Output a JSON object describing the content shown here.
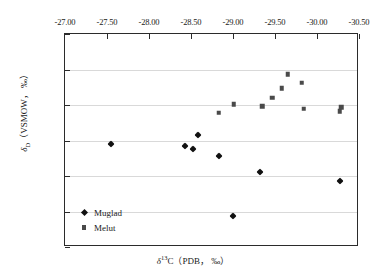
{
  "chart_data": {
    "type": "scatter",
    "title": "",
    "xlabel": "δ¹³C (PDB, ‰)",
    "ylabel": "δD (VSMOW, ‰)",
    "xlabel_parts": {
      "symbol": "δ",
      "superscript": "13",
      "rest": "C（PDB， ‰）"
    },
    "ylabel_parts": {
      "symbol": "δ",
      "subscript": "D",
      "rest": "（VSMOW， ‰）"
    },
    "xlim": [
      -27.0,
      -30.5
    ],
    "ylim": [
      -140,
      -80
    ],
    "x_axis_position": "top",
    "x_tick_labels": [
      "-27.00",
      "-27.50",
      "-28.00",
      "-28.50",
      "-29.00",
      "-29.50",
      "-30.00",
      "-30.50"
    ],
    "x_ticks": [
      -27.0,
      -27.5,
      -28.0,
      -28.5,
      -29.0,
      -29.5,
      -30.0,
      -30.5
    ],
    "y_tick_labels": [
      "-80",
      "-90",
      "-100",
      "-110",
      "-120",
      "-130",
      "-140"
    ],
    "y_ticks": [
      -80,
      -90,
      -100,
      -110,
      -120,
      -130,
      -140
    ],
    "grid": "horizontal",
    "gridline_values": [
      -90,
      -100,
      -110,
      -120,
      -130
    ],
    "legend_position": "bottom-left",
    "marker_color": "#111111",
    "series": [
      {
        "name": "Muglad",
        "marker": "diamond",
        "color": "#111111",
        "points": [
          {
            "x": -27.55,
            "y": -108.9
          },
          {
            "x": -28.43,
            "y": -108.4
          },
          {
            "x": -28.52,
            "y": -107.7
          },
          {
            "x": -28.58,
            "y": -111.5
          },
          {
            "x": -28.83,
            "y": -105.7
          },
          {
            "x": -29.0,
            "y": -88.6
          },
          {
            "x": -29.32,
            "y": -101.2
          },
          {
            "x": -30.27,
            "y": -98.6
          }
        ]
      },
      {
        "name": "Melut",
        "marker": "square",
        "color": "#4a4a4a",
        "points": [
          {
            "x": -28.83,
            "y": -117.8
          },
          {
            "x": -29.01,
            "y": -120.2
          },
          {
            "x": -29.35,
            "y": -119.7
          },
          {
            "x": -29.47,
            "y": -122.1
          },
          {
            "x": -29.58,
            "y": -124.7
          },
          {
            "x": -29.65,
            "y": -128.7
          },
          {
            "x": -29.82,
            "y": -126.2
          },
          {
            "x": -29.84,
            "y": -119.0
          },
          {
            "x": -30.27,
            "y": -118.2
          },
          {
            "x": -30.29,
            "y": -119.4
          }
        ]
      }
    ]
  },
  "legend": {
    "items": [
      {
        "label": "Muglad",
        "marker": "diamond"
      },
      {
        "label": "Melut",
        "marker": "square"
      }
    ]
  }
}
